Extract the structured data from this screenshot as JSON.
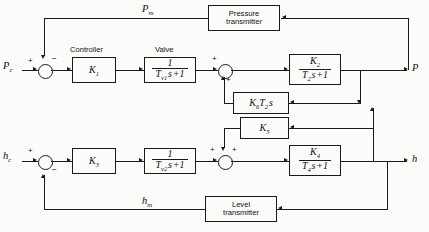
{
  "diagram": {
    "line_color": "#1a1a1a",
    "background": "#fbfbf9"
  },
  "signals": {
    "pressure_setpoint": "Pc",
    "level_setpoint": "hc",
    "pressure_measured": "Pm",
    "level_measured": "hm",
    "pressure_output": "P",
    "level_output": "h"
  },
  "captions": {
    "controller": "Controller",
    "valve": "Valve"
  },
  "blocks": {
    "controller_k1": "K1",
    "valve_upper_num": "1",
    "valve_upper_den": "Tv1 s + 1",
    "process_upper_num": "K2",
    "process_upper_den": "T2 s + 1",
    "derivative_feedback": "K6T2 s",
    "pressure_transmitter": "Pressure transmitter",
    "controller_k3": "K3",
    "valve_lower_num": "1",
    "valve_lower_den": "Tv2 s + 1",
    "cross_gain_k5": "K5",
    "process_lower_num": "K4",
    "process_lower_den": "T4 s + 1",
    "level_transmitter": "Level transmitter"
  },
  "summing_junctions": [
    {
      "name": "pressure-error",
      "inputs": [
        {
          "port": "left",
          "sign": "+"
        },
        {
          "port": "top",
          "sign": "-"
        }
      ]
    },
    {
      "name": "pressure-inner",
      "inputs": [
        {
          "port": "left",
          "sign": "+"
        },
        {
          "port": "bottom",
          "sign": "+"
        }
      ]
    },
    {
      "name": "level-error",
      "inputs": [
        {
          "port": "left",
          "sign": "+"
        },
        {
          "port": "bottom",
          "sign": "-"
        }
      ]
    },
    {
      "name": "level-inner",
      "inputs": [
        {
          "port": "left",
          "sign": "+"
        },
        {
          "port": "top",
          "sign": "+"
        }
      ]
    }
  ],
  "signs": {
    "plus": "+",
    "minus": "−"
  }
}
